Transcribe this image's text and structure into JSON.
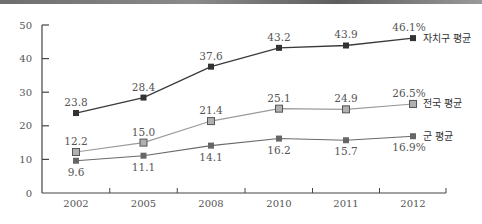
{
  "chart_data": {
    "type": "line",
    "title": "",
    "xlabel": "",
    "ylabel": "",
    "categories": [
      "2002",
      "2005",
      "2008",
      "2010",
      "2011",
      "2012"
    ],
    "ylim": [
      0,
      50
    ],
    "yticks": [
      "0",
      "10",
      "20",
      "30",
      "40",
      "50"
    ],
    "grid": false,
    "legend_position": "inline-right",
    "series": [
      {
        "name": "자치구 평균",
        "values": [
          23.8,
          28.4,
          37.6,
          43.2,
          43.9,
          46.1
        ],
        "labels": [
          "23.8",
          "28.4",
          "37.6",
          "43.2",
          "43.9",
          "46.1%"
        ],
        "color": "#3a3a3a",
        "marker": "filled-square"
      },
      {
        "name": "전국 평균",
        "values": [
          12.2,
          15.0,
          21.4,
          25.1,
          24.9,
          26.5
        ],
        "labels": [
          "12.2",
          "15.0",
          "21.4",
          "25.1",
          "24.9",
          "26.5%"
        ],
        "color": "#9a9a9a",
        "marker": "outlined-square"
      },
      {
        "name": "군 평균",
        "values": [
          9.6,
          11.1,
          14.1,
          16.2,
          15.7,
          16.9
        ],
        "labels": [
          "9.6",
          "11.1",
          "14.1",
          "16.2",
          "15.7",
          "16.9%"
        ],
        "color": "#6a6a6a",
        "marker": "filled-square"
      }
    ]
  }
}
